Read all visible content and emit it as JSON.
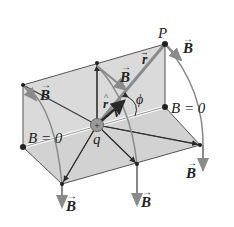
{
  "diagram": {
    "labels": {
      "point_p": "P",
      "charge": "q",
      "angle": "ϕ",
      "r_vec": "r",
      "r_hat": "r",
      "v_vec": "v",
      "b_vec": "B",
      "b_zero_right": "B = 0",
      "b_zero_left": "B = 0",
      "b_top_right": "B",
      "b_upper_left": "B",
      "b_middle": "B",
      "b_bottom_left": "B",
      "b_bottom_middle": "B",
      "b_bottom_right": "B"
    },
    "colors": {
      "plane_fill": "#d9d9d9",
      "line": "#3a3a3a",
      "arrow_gray": "#8a8a8a",
      "vector_dark": "#2a2a2a",
      "charge_fill": "#9a9a9a"
    }
  }
}
